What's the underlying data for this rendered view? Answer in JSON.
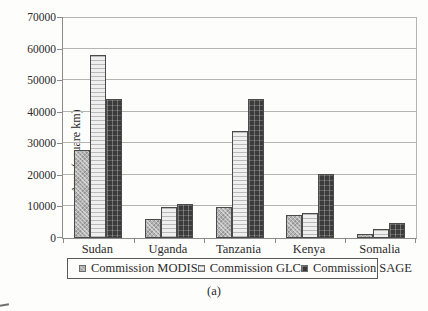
{
  "figure": {
    "caption": "(a)"
  },
  "chart_data": {
    "type": "bar",
    "title": "",
    "xlabel": "",
    "ylabel": "Area (square km)",
    "ylim": [
      0,
      70000
    ],
    "yticks": [
      0,
      10000,
      20000,
      30000,
      40000,
      50000,
      60000,
      70000
    ],
    "grid": true,
    "legend_position": "bottom",
    "categories": [
      "Sudan",
      "Uganda",
      "Tanzania",
      "Kenya",
      "Somalia"
    ],
    "series": [
      {
        "name": "Commission MODIS",
        "pattern": "checker-gray",
        "fill": "#b3b3b3",
        "values": [
          28000,
          6000,
          9700,
          7300,
          1400
        ]
      },
      {
        "name": "Commission GLC",
        "pattern": "hlines-light",
        "fill": "#efefef",
        "values": [
          58000,
          9800,
          34000,
          7800,
          2700
        ]
      },
      {
        "name": "Commission SAGE",
        "pattern": "grid-dark",
        "fill": "#3b3b3b",
        "values": [
          44000,
          10700,
          44000,
          20400,
          4800
        ]
      }
    ],
    "colors": {
      "bar_border": "#4a4a4a",
      "gridline": "#b4b4b4",
      "axis": "#8a8a8a",
      "text": "#2a2a2a",
      "background": "#fdfdfc"
    }
  }
}
